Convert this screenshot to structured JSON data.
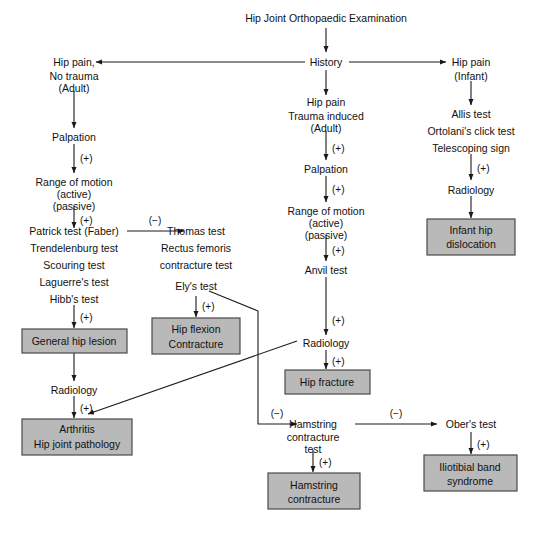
{
  "diagram": {
    "title": "Hip Joint Orthopaedic Examination",
    "type": "clinical-decision-flowchart",
    "colors": {
      "box_fill": "#b9b9b9",
      "box_border": "#4a4a4a",
      "line": "#1a1a1a",
      "text": "#111111",
      "background": "#ffffff"
    },
    "nodes": {
      "root": "Hip Joint Orthopaedic Examination",
      "history": "History",
      "left_branch": {
        "entry_line1": "Hip pain,",
        "entry_line2": "No trauma",
        "entry_line3": "(Adult)",
        "palpation": "Palpation",
        "rom_line1": "Range of motion",
        "rom_line2": "(active)",
        "rom_line3": "(passive)",
        "tests_line1": "Patrick test (Faber)",
        "tests_line2": "Trendelenburg test",
        "tests_line3": "Scouring test",
        "tests_line4": "Laguerre's test",
        "tests_line5": "Hibb's test",
        "outcome_box": "General hip lesion",
        "radiology": "Radiology",
        "final_box_line1": "Arthritis",
        "final_box_line2": "Hip joint pathology"
      },
      "thomas_branch": {
        "tests_line1": "Thomas test",
        "tests_line2": "Rectus femoris",
        "tests_line3": "contracture test",
        "tests_line4": "Ely's test",
        "outcome_box_line1": "Hip flexion",
        "outcome_box_line2": "Contracture"
      },
      "center_branch": {
        "entry_line1": "Hip pain",
        "entry_line2": "Trauma induced",
        "entry_line3": "(Adult)",
        "palpation": "Palpation",
        "rom_line1": "Range of motion",
        "rom_line2": "(active)",
        "rom_line3": "(passive)",
        "anvil": "Anvil test",
        "radiology": "Radiology",
        "outcome_box": "Hip fracture"
      },
      "hamstring_branch": {
        "test_line1": "Hamstring",
        "test_line2": "contracture",
        "test_line3": "test",
        "outcome_box_line1": "Hamstring",
        "outcome_box_line2": "contracture"
      },
      "ober_branch": {
        "test": "Ober's test",
        "outcome_box_line1": "Iliotibial band",
        "outcome_box_line2": "syndrome"
      },
      "right_branch": {
        "entry_line1": "Hip pain",
        "entry_line2": "(Infant)",
        "tests_line1": "Allis test",
        "tests_line2": "Ortolani's click test",
        "tests_line3": "Telescoping sign",
        "radiology": "Radiology",
        "outcome_box_line1": "Infant hip",
        "outcome_box_line2": "dislocation"
      }
    },
    "edge_labels": {
      "positive": "(+)",
      "negative": "(−)",
      "left_rom_pos": "(+)",
      "left_tests_pos": "(+)",
      "left_palp_pos": "(+)",
      "left_radiology_pos": "(+)",
      "patrick_to_thomas_neg": "(−)",
      "ely_pos": "(+)",
      "center_entry_pos": "(+)",
      "center_palp_pos": "(+)",
      "center_rom_pos": "(+)",
      "center_anvil_pos": "(+)",
      "center_radiology_pos": "(+)",
      "ely_to_hamstring_neg": "(−)",
      "hamstring_pos": "(+)",
      "hamstring_to_ober_neg": "(−)",
      "ober_pos": "(+)",
      "right_tests_pos": "(+)"
    }
  }
}
